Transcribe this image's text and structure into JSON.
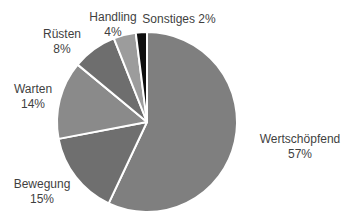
{
  "chart_data": {
    "type": "pie",
    "title": "",
    "legend": "none",
    "label_style": "outside: category name + percent",
    "direction": "clockwise",
    "start_angle_deg": 0,
    "background": "#ffffff",
    "text_color": "#3f3f3f",
    "slice_border_color": "#ffffff",
    "categories": [
      "Wertschöpfend",
      "Bewegung",
      "Warten",
      "Rüsten",
      "Handling",
      "Sonstiges"
    ],
    "values": [
      57,
      15,
      14,
      8,
      4,
      2
    ],
    "slices": [
      {
        "label": "Wertschöpfend",
        "value": 57,
        "pct_label": "57%",
        "color": "#7f7f7f"
      },
      {
        "label": "Bewegung",
        "value": 15,
        "pct_label": "15%",
        "color": "#6f6f6f"
      },
      {
        "label": "Warten",
        "value": 14,
        "pct_label": "14%",
        "color": "#8a8a8a"
      },
      {
        "label": "Rüsten",
        "value": 8,
        "pct_label": "8%",
        "color": "#6e6e6e"
      },
      {
        "label": "Handling",
        "value": 4,
        "pct_label": "4%",
        "color": "#9c9c9c"
      },
      {
        "label": "Sonstiges",
        "value": 2,
        "pct_label": "2%",
        "color": "#0f0f0f"
      }
    ]
  }
}
